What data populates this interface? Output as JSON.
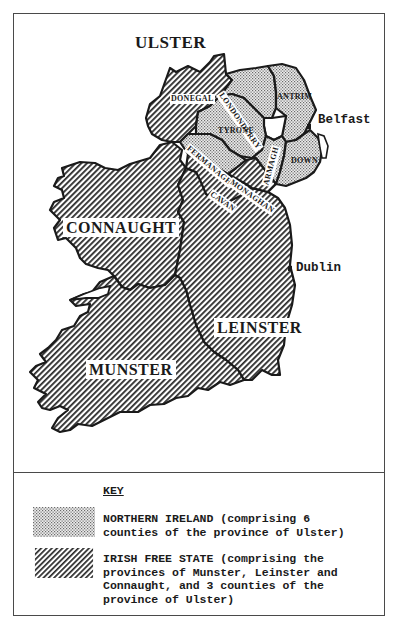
{
  "map": {
    "province_labels": {
      "ulster": "ULSTER",
      "connaught": "CONNAUGHT",
      "leinster": "LEINSTER",
      "munster": "MUNSTER"
    },
    "county_labels": {
      "donegal": "DONEGAL",
      "londonderry": "LONDONDERRY",
      "antrim": "ANTRIM",
      "tyrone": "TYRONE",
      "fermanagh": "FERMANAGH",
      "armagh": "ARMAGH",
      "down": "DOWN",
      "monaghan": "MONAGHAN",
      "cavan": "CAVAN"
    },
    "cities": {
      "belfast": "Belfast",
      "dublin": "Dublin"
    },
    "colors": {
      "outline": "#1a1a1a",
      "frame": "#4a4a4a",
      "background": "#ffffff"
    }
  },
  "key": {
    "title": "KEY",
    "items": [
      {
        "pattern": "dotted",
        "text": "NORTHERN IRELAND (comprising 6\ncounties of the province of Ulster)"
      },
      {
        "pattern": "hatched",
        "text": "IRISH FREE STATE (comprising the\nprovinces of Munster, Leinster and\nConnaught, and 3 counties of the\nprovince of Ulster)"
      }
    ]
  }
}
